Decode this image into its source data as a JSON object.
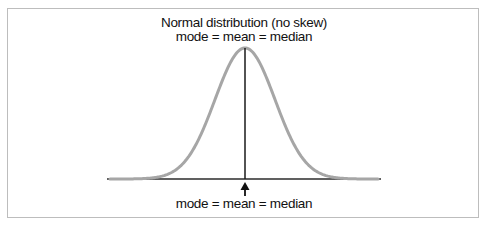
{
  "diagram": {
    "title": "Normal distribution (no skew)",
    "subtitle": "mode = mean = median",
    "bottom_label": "mode = mean = median",
    "colors": {
      "curve": "#a6a6a6",
      "axis": "#2b2b2b",
      "center_line": "#1a1a1a",
      "frame": "#bdbdbd"
    }
  },
  "chart_data": {
    "type": "line",
    "title": "Normal distribution (no skew)",
    "subtitle": "mode = mean = median",
    "annotations": [
      "mode = mean = median"
    ],
    "distribution": "normal",
    "skew": 0,
    "center_marker": "mode = mean = median",
    "xlabel": "",
    "ylabel": "",
    "grid": false
  }
}
